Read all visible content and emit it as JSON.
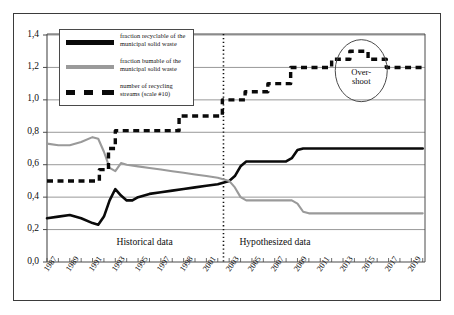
{
  "chart_data": {
    "type": "line",
    "title": "",
    "xlabel": "",
    "ylabel": "",
    "xlim": [
      1987,
      2020
    ],
    "ylim": [
      0.0,
      1.4
    ],
    "grid": true,
    "y_ticks": [
      "0,0",
      "0,2",
      "0,4",
      "0,6",
      "0,8",
      "1,0",
      "1,2",
      "1,4"
    ],
    "y_tick_values": [
      0.0,
      0.2,
      0.4,
      0.6,
      0.8,
      1.0,
      1.2,
      1.4
    ],
    "x_tick_labels": [
      "1987",
      "1989",
      "1991",
      "1993",
      "1995",
      "1997",
      "1998",
      "2001",
      "2003",
      "2005",
      "2007",
      "2009",
      "2011",
      "2013",
      "2015",
      "2017",
      "2019"
    ],
    "x_tick_values": [
      1987,
      1989,
      1991,
      1993,
      1995,
      1997,
      1999,
      2001,
      2003,
      2005,
      2007,
      2009,
      2011,
      2013,
      2015,
      2017,
      2019
    ],
    "legend_position": "top-left",
    "series": [
      {
        "name": "fraction recyclable of the municipal solid waste",
        "style": "solid",
        "color": "#0a0a0a",
        "x": [
          1987,
          1988,
          1989,
          1990,
          1991,
          1991.5,
          1992,
          1992.5,
          1993,
          1993.5,
          1994,
          1994.5,
          1995,
          1996,
          1997,
          1998,
          1999,
          2000,
          2001,
          2002,
          2003,
          2003.5,
          2004,
          2004.5,
          2005,
          2006,
          2007,
          2008,
          2008.5,
          2009,
          2009.5,
          2010,
          2011,
          2012,
          2013,
          2014,
          2015,
          2016,
          2017,
          2018,
          2019,
          2020
        ],
        "y": [
          0.27,
          0.28,
          0.29,
          0.27,
          0.24,
          0.23,
          0.28,
          0.38,
          0.45,
          0.41,
          0.38,
          0.38,
          0.4,
          0.42,
          0.43,
          0.44,
          0.45,
          0.46,
          0.47,
          0.48,
          0.5,
          0.53,
          0.59,
          0.62,
          0.62,
          0.62,
          0.62,
          0.62,
          0.64,
          0.69,
          0.7,
          0.7,
          0.7,
          0.7,
          0.7,
          0.7,
          0.7,
          0.7,
          0.7,
          0.7,
          0.7,
          0.7
        ]
      },
      {
        "name": "fraction bumable of the municipal solid waste",
        "style": "solid",
        "color": "#9a9a9a",
        "x": [
          1987,
          1988,
          1989,
          1990,
          1991,
          1991.5,
          1992,
          1992.5,
          1993,
          1993.5,
          1994,
          1995,
          1996,
          1997,
          1998,
          1999,
          2000,
          2001,
          2002,
          2003,
          2003.5,
          2004,
          2004.5,
          2005,
          2006,
          2007,
          2008,
          2008.5,
          2009,
          2009.5,
          2010,
          2011,
          2012,
          2013,
          2014,
          2015,
          2016,
          2017,
          2018,
          2019,
          2020
        ],
        "y": [
          0.73,
          0.72,
          0.72,
          0.74,
          0.77,
          0.76,
          0.68,
          0.58,
          0.56,
          0.61,
          0.6,
          0.59,
          0.58,
          0.57,
          0.56,
          0.55,
          0.54,
          0.53,
          0.52,
          0.5,
          0.46,
          0.4,
          0.38,
          0.38,
          0.38,
          0.38,
          0.38,
          0.38,
          0.36,
          0.31,
          0.3,
          0.3,
          0.3,
          0.3,
          0.3,
          0.3,
          0.3,
          0.3,
          0.3,
          0.3,
          0.3
        ]
      },
      {
        "name": "number of recycling streams (scale #10)",
        "style": "dashed",
        "color": "#0a0a0a",
        "x": [
          1987,
          1991.6,
          1991.6,
          1992.4,
          1992.4,
          1993.0,
          1993.0,
          1998.6,
          1998.6,
          2000.2,
          2000.2,
          2002.4,
          2002.4,
          2004.4,
          2004.4,
          2006.4,
          2006.4,
          2008.4,
          2008.4,
          2012.0,
          2012.0,
          2013.6,
          2013.6,
          2015.2,
          2015.2,
          2016.8,
          2016.8,
          2020
        ],
        "y": [
          0.5,
          0.5,
          0.57,
          0.57,
          0.7,
          0.7,
          0.81,
          0.81,
          0.9,
          0.9,
          0.9,
          0.9,
          1.0,
          1.0,
          1.05,
          1.05,
          1.1,
          1.1,
          1.2,
          1.2,
          1.25,
          1.25,
          1.3,
          1.3,
          1.25,
          1.25,
          1.2,
          1.2
        ]
      }
    ],
    "annotations": [
      {
        "id": "overshoot",
        "text": "Over-\nshoot",
        "x": 2014.6,
        "y": 1.18,
        "shape": "ellipse"
      },
      {
        "id": "historical",
        "text": "Historical data",
        "x": 1996.0,
        "y": 0.12
      },
      {
        "id": "hypothesized",
        "text": "Hypothesized data",
        "x": 2007.5,
        "y": 0.12
      },
      {
        "id": "divider",
        "text": "",
        "x": 2002.5,
        "style": "dotted-vertical"
      }
    ]
  },
  "legend": {
    "items": [
      {
        "label_line1": "fraction recyclable of the",
        "label_line2": "municipal solid waste",
        "swatch": "solid-black",
        "color": "#0a0a0a"
      },
      {
        "label_line1": "fraction bumable of the",
        "label_line2": "municipal solid waste",
        "swatch": "solid-gray",
        "color": "#9a9a9a"
      },
      {
        "label_line1": "number of recycling",
        "label_line2": "streams (scale #10)",
        "swatch": "dashed-black",
        "color": "#0a0a0a"
      }
    ]
  },
  "annotations": {
    "overshoot_line1": "Over-",
    "overshoot_line2": "shoot",
    "historical": "Historical data",
    "hypothesized": "Hypothesized data"
  },
  "axis": {
    "y_labels": [
      "1,4",
      "1,2",
      "1,0",
      "0,8",
      "0,6",
      "0,4",
      "0,2",
      "0,0"
    ],
    "x_labels": [
      "1987",
      "1989",
      "1991",
      "1993",
      "1995",
      "1997",
      "1998",
      "2001",
      "2003",
      "2005",
      "2007",
      "2009",
      "2011",
      "2013",
      "2015",
      "2017",
      "2019"
    ]
  },
  "colors": {
    "series_recyclable": "#0a0a0a",
    "series_bumable": "#9a9a9a",
    "series_streams": "#0a0a0a",
    "gridline": "#8d8d8d",
    "axis": "#4a4a4a",
    "frame": "#3b3b3b"
  }
}
